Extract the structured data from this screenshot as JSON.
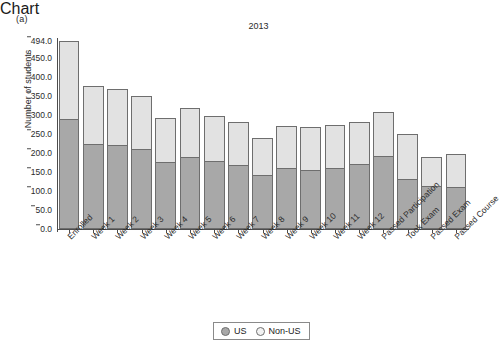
{
  "panel": {
    "label": "(a)"
  },
  "legend": {
    "items": [
      {
        "label": "US",
        "swatch": "filled-circle-icon",
        "color": "#a8a8a8"
      },
      {
        "label": "Non-US",
        "swatch": "open-circle-icon",
        "color": "#f2f2f2"
      }
    ]
  },
  "chart_data": {
    "type": "bar",
    "stacked": true,
    "title": "2013",
    "xlabel": "",
    "ylabel": "Number of students",
    "ylim": [
      0,
      494
    ],
    "grid": false,
    "legend_position": "bottom-center",
    "ytick_labels": [
      "0.0",
      "50.0",
      "100.0",
      "150.0",
      "200.0",
      "250.0",
      "300.0",
      "350.0",
      "400.0",
      "450.0",
      "494.0"
    ],
    "ytick_values": [
      0,
      50,
      100,
      150,
      200,
      250,
      300,
      350,
      400,
      450,
      494
    ],
    "categories": [
      "Enrolled",
      "Week 1",
      "Week 2",
      "Week 3",
      "Week 4",
      "Week 5",
      "Week 6",
      "Week 7",
      "Week 8",
      "Week 9",
      "Week 10",
      "Week 11",
      "Week 12",
      "Passed Participation",
      "Took Exam",
      "Passed Exam",
      "Passed Course"
    ],
    "series": [
      {
        "name": "US",
        "color": "#a8a8a8",
        "values": [
          290,
          224,
          222,
          210,
          176,
          188,
          178,
          168,
          143,
          160,
          156,
          161,
          172,
          192,
          131,
          112,
          110
        ]
      },
      {
        "name": "Non-US",
        "color": "#e2e2e2",
        "values": [
          204,
          151,
          146,
          140,
          117,
          131,
          119,
          113,
          97,
          110,
          112,
          112,
          108,
          115,
          118,
          78,
          86
        ]
      }
    ],
    "totals": [
      494,
      375,
      368,
      350,
      293,
      319,
      297,
      281,
      240,
      270,
      268,
      273,
      280,
      307,
      249,
      190,
      196
    ]
  }
}
